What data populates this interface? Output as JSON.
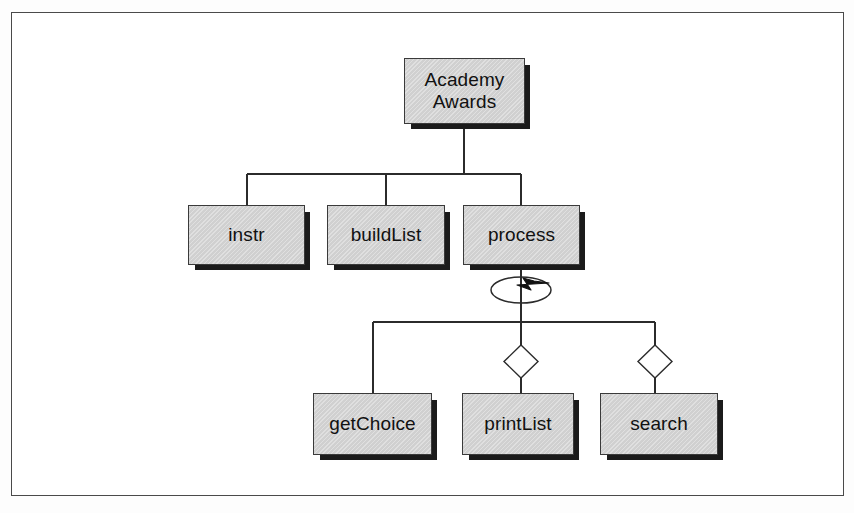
{
  "diagram": {
    "kind": "structure-chart",
    "title_text": "",
    "background_color": "#ffffff",
    "frame_border_color": "#4a4a4a",
    "box_fill_color": "#d2d2d2",
    "box_border_color": "#3a3a3a",
    "box_shadow_color": "#1b1b1b",
    "line_color": "#2b2b2b"
  },
  "nodes": {
    "root": {
      "id": "academy-awards",
      "label": "Academy\nAwards",
      "line1": "Academy",
      "line2": "Awards",
      "level": "root"
    },
    "level1": [
      {
        "id": "instr",
        "label": "instr",
        "level": "module"
      },
      {
        "id": "buildList",
        "label": "buildList",
        "level": "module"
      },
      {
        "id": "process",
        "label": "process",
        "level": "module"
      }
    ],
    "level2": [
      {
        "id": "getChoice",
        "label": "getChoice",
        "level": "module"
      },
      {
        "id": "printList",
        "label": "printList",
        "level": "module"
      },
      {
        "id": "search",
        "label": "search",
        "level": "module"
      }
    ]
  },
  "symbols": {
    "iteration": {
      "name": "loop-iteration-symbol",
      "description": "ellipse with arrowhead indicating repetition",
      "attached_to": "process"
    },
    "selection": [
      {
        "name": "selection-diamond-symbol",
        "attached_to": "printList"
      },
      {
        "name": "selection-diamond-symbol",
        "attached_to": "search"
      }
    ]
  },
  "connections": [
    {
      "from": "academy-awards",
      "to": "instr"
    },
    {
      "from": "academy-awards",
      "to": "buildList"
    },
    {
      "from": "academy-awards",
      "to": "process"
    },
    {
      "from": "process",
      "to": "getChoice"
    },
    {
      "from": "process",
      "to": "printList",
      "via": "selection-diamond"
    },
    {
      "from": "process",
      "to": "search",
      "via": "selection-diamond"
    }
  ]
}
